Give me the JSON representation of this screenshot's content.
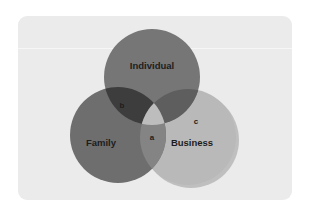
{
  "diagram": {
    "type": "venn-3-set",
    "title": "",
    "background_color": "#ffffff",
    "card_color": "#ebebeb",
    "sets": [
      {
        "id": "individual",
        "label": "Individual",
        "color": "#767676",
        "cx": 152,
        "cy": 77,
        "r": 48,
        "label_x": 152,
        "label_y": 66
      },
      {
        "id": "family",
        "label": "Family",
        "color": "#6e6e6e",
        "cx": 118,
        "cy": 135,
        "r": 48,
        "label_x": 101,
        "label_y": 143
      },
      {
        "id": "business",
        "label": "Business",
        "color": "#b9b9b9",
        "cx": 188,
        "cy": 137,
        "r": 48,
        "label_x": 192,
        "label_y": 143
      }
    ],
    "regions": [
      {
        "id": "center-triple",
        "label": "a",
        "description": "Individual and Family and Business",
        "color": "#bdbdbd",
        "label_x": 152,
        "label_y": 138
      },
      {
        "id": "individual-family",
        "label": "b",
        "description": "Individual and Family",
        "color": "#3d3d3d",
        "label_x": 122,
        "label_y": 106
      },
      {
        "id": "business-only",
        "label": "c",
        "description": "Business only",
        "color": "#b9b9b9",
        "label_x": 196,
        "label_y": 122
      }
    ],
    "overlap_colors": {
      "individual_family": "#3d3d3d",
      "individual_business": "#5e5e5e",
      "family_business": "#848484",
      "triple": "#bdbdbd"
    },
    "shadow_color": "#9a9a9a"
  }
}
